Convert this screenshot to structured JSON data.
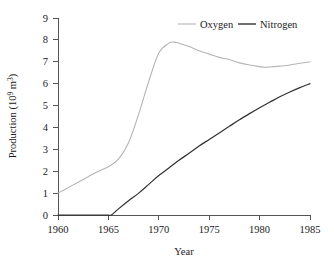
{
  "chart_data": {
    "type": "line",
    "title": "",
    "xlabel": "Year",
    "ylabel": "Production (10⁹ m³)",
    "ylabel_parts": {
      "prefix": "Production (10",
      "exponent": "9",
      "mid": " m",
      "exponent2": "3",
      "suffix": ")"
    },
    "xlim": [
      1960,
      1985
    ],
    "ylim": [
      0,
      9
    ],
    "grid": false,
    "legend_position": "top-right",
    "x_ticks": [
      1960,
      1965,
      1970,
      1975,
      1980,
      1985
    ],
    "x_tick_labels": [
      "1960",
      "1965",
      "1970",
      "1975",
      "1980",
      "1985"
    ],
    "y_ticks": [
      0,
      1,
      2,
      3,
      4,
      5,
      6,
      7,
      8,
      9
    ],
    "y_tick_labels": [
      "0",
      "1",
      "2",
      "3",
      "4",
      "5",
      "6",
      "7",
      "8",
      "9"
    ],
    "series": [
      {
        "name": "Oxygen",
        "color": "#b5b5b5",
        "x": [
          1960,
          1961,
          1962,
          1963,
          1964,
          1965,
          1966,
          1967,
          1968,
          1969,
          1970,
          1971,
          1971.5,
          1972,
          1973,
          1974,
          1975,
          1976,
          1977,
          1978,
          1979,
          1980,
          1980.5,
          1981,
          1982,
          1983,
          1984,
          1985
        ],
        "values": [
          1.0,
          1.25,
          1.5,
          1.75,
          2.0,
          2.2,
          2.55,
          3.3,
          4.6,
          6.1,
          7.4,
          7.85,
          7.9,
          7.85,
          7.7,
          7.5,
          7.35,
          7.2,
          7.1,
          6.95,
          6.85,
          6.78,
          6.75,
          6.76,
          6.8,
          6.85,
          6.93,
          7.0
        ]
      },
      {
        "name": "Nitrogen",
        "color": "#333333",
        "x": [
          1960,
          1961,
          1962,
          1963,
          1964,
          1965,
          1965.3,
          1966,
          1967,
          1968,
          1969,
          1970,
          1971,
          1972,
          1973,
          1974,
          1975,
          1976,
          1977,
          1978,
          1979,
          1980,
          1981,
          1982,
          1983,
          1984,
          1985
        ],
        "values": [
          0.0,
          0.0,
          0.0,
          0.0,
          0.0,
          0.0,
          0.0,
          0.28,
          0.65,
          1.0,
          1.4,
          1.8,
          2.15,
          2.5,
          2.82,
          3.15,
          3.45,
          3.75,
          4.05,
          4.35,
          4.63,
          4.9,
          5.15,
          5.4,
          5.62,
          5.82,
          6.0
        ]
      }
    ]
  },
  "legend": {
    "items": [
      {
        "label": "Oxygen",
        "color": "#b5b5b5"
      },
      {
        "label": "Nitrogen",
        "color": "#333333"
      }
    ]
  },
  "axes": {
    "x_title": "Year",
    "y_title": "Production (10⁹ m³)"
  }
}
